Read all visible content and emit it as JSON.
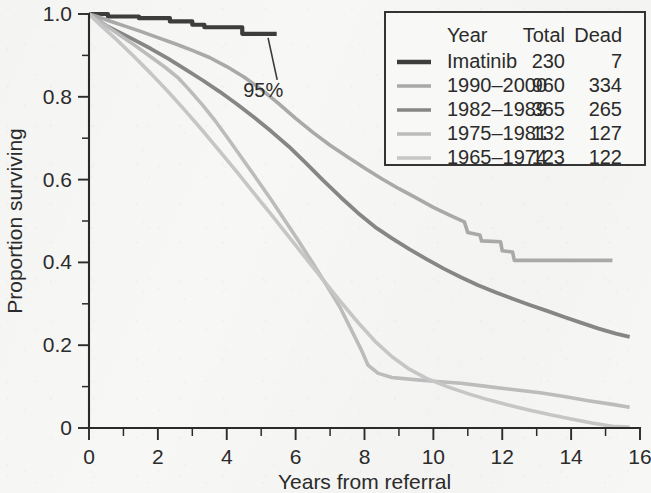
{
  "chart_data": {
    "type": "line",
    "title": "",
    "xlabel": "Years from referral",
    "ylabel": "Proportion surviving",
    "xlim": [
      0,
      16
    ],
    "ylim": [
      0,
      1.0
    ],
    "grid": false,
    "x_ticks": [
      "0",
      "2",
      "4",
      "6",
      "8",
      "10",
      "12",
      "14",
      "16"
    ],
    "x_tick_values": [
      0,
      2,
      4,
      6,
      8,
      10,
      12,
      14,
      16
    ],
    "x_minor_tick_values": [
      1,
      3,
      5,
      7,
      9,
      11,
      13,
      15
    ],
    "y_ticks": [
      "0",
      "0.2",
      "0.4",
      "0.6",
      "0.8",
      "1.0"
    ],
    "y_tick_values": [
      0,
      0.2,
      0.4,
      0.6,
      0.8,
      1.0
    ],
    "y_minor_tick_values": [
      0.1,
      0.3,
      0.5,
      0.7,
      0.9
    ],
    "legend_position": "top-right",
    "annotations": [
      {
        "text": "95%",
        "x": 5.0,
        "y": 0.8,
        "points_to_x": 5.2,
        "points_to_y": 0.952
      }
    ],
    "series": [
      {
        "name": "Imatinib",
        "total": 230,
        "dead": 7,
        "color": "#3d3d3d",
        "width": 4.2,
        "points": [
          [
            0,
            1.0
          ],
          [
            0.55,
            1.0
          ],
          [
            0.55,
            0.994
          ],
          [
            1.45,
            0.994
          ],
          [
            1.45,
            0.99
          ],
          [
            2.35,
            0.99
          ],
          [
            2.35,
            0.982
          ],
          [
            3.0,
            0.982
          ],
          [
            3.0,
            0.974
          ],
          [
            3.35,
            0.974
          ],
          [
            3.35,
            0.968
          ],
          [
            4.45,
            0.968
          ],
          [
            4.45,
            0.952
          ],
          [
            5.45,
            0.952
          ]
        ]
      },
      {
        "name": "1990–2000",
        "total": 960,
        "dead": 334,
        "color": "#a9a9a9",
        "width": 3.6,
        "points": [
          [
            0,
            1.0
          ],
          [
            0.3,
            0.992
          ],
          [
            0.6,
            0.983
          ],
          [
            1.0,
            0.972
          ],
          [
            1.5,
            0.958
          ],
          [
            2.0,
            0.943
          ],
          [
            2.5,
            0.928
          ],
          [
            3.0,
            0.912
          ],
          [
            3.5,
            0.895
          ],
          [
            4.0,
            0.873
          ],
          [
            4.5,
            0.848
          ],
          [
            5.0,
            0.818
          ],
          [
            5.5,
            0.784
          ],
          [
            6.0,
            0.748
          ],
          [
            6.5,
            0.714
          ],
          [
            7.0,
            0.683
          ],
          [
            7.5,
            0.655
          ],
          [
            8.0,
            0.628
          ],
          [
            8.5,
            0.602
          ],
          [
            9.0,
            0.578
          ],
          [
            9.5,
            0.556
          ],
          [
            10.0,
            0.533
          ],
          [
            10.5,
            0.513
          ],
          [
            10.9,
            0.498
          ],
          [
            11.0,
            0.472
          ],
          [
            11.35,
            0.466
          ],
          [
            11.4,
            0.452
          ],
          [
            11.95,
            0.45
          ],
          [
            12.0,
            0.428
          ],
          [
            12.3,
            0.425
          ],
          [
            12.35,
            0.405
          ],
          [
            15.2,
            0.405
          ]
        ]
      },
      {
        "name": "1982–1989",
        "total": 365,
        "dead": 265,
        "color": "#868686",
        "width": 3.8,
        "points": [
          [
            0,
            1.0
          ],
          [
            0.25,
            0.985
          ],
          [
            0.5,
            0.972
          ],
          [
            0.9,
            0.955
          ],
          [
            1.3,
            0.938
          ],
          [
            1.8,
            0.916
          ],
          [
            2.3,
            0.892
          ],
          [
            2.8,
            0.866
          ],
          [
            3.3,
            0.84
          ],
          [
            3.8,
            0.812
          ],
          [
            4.3,
            0.782
          ],
          [
            4.8,
            0.75
          ],
          [
            5.3,
            0.716
          ],
          [
            5.8,
            0.68
          ],
          [
            6.3,
            0.64
          ],
          [
            6.8,
            0.598
          ],
          [
            7.3,
            0.558
          ],
          [
            7.8,
            0.52
          ],
          [
            8.3,
            0.486
          ],
          [
            8.8,
            0.458
          ],
          [
            9.3,
            0.432
          ],
          [
            9.8,
            0.408
          ],
          [
            10.3,
            0.385
          ],
          [
            10.8,
            0.364
          ],
          [
            11.3,
            0.345
          ],
          [
            11.8,
            0.328
          ],
          [
            12.3,
            0.312
          ],
          [
            12.8,
            0.297
          ],
          [
            13.3,
            0.283
          ],
          [
            13.8,
            0.268
          ],
          [
            14.3,
            0.254
          ],
          [
            14.8,
            0.24
          ],
          [
            15.3,
            0.228
          ],
          [
            15.7,
            0.22
          ]
        ]
      },
      {
        "name": "1975–1981",
        "total": 132,
        "dead": 127,
        "color": "#bcbcbc",
        "width": 3.6,
        "points": [
          [
            0,
            1.0
          ],
          [
            0.3,
            0.982
          ],
          [
            0.7,
            0.96
          ],
          [
            1.2,
            0.932
          ],
          [
            1.7,
            0.902
          ],
          [
            2.2,
            0.872
          ],
          [
            2.6,
            0.845
          ],
          [
            2.9,
            0.818
          ],
          [
            3.3,
            0.78
          ],
          [
            3.7,
            0.738
          ],
          [
            4.1,
            0.692
          ],
          [
            4.5,
            0.645
          ],
          [
            4.9,
            0.598
          ],
          [
            5.3,
            0.55
          ],
          [
            5.7,
            0.5
          ],
          [
            6.1,
            0.45
          ],
          [
            6.5,
            0.398
          ],
          [
            6.9,
            0.345
          ],
          [
            7.3,
            0.29
          ],
          [
            7.6,
            0.24
          ],
          [
            7.9,
            0.19
          ],
          [
            8.1,
            0.152
          ],
          [
            8.4,
            0.132
          ],
          [
            8.8,
            0.122
          ],
          [
            9.3,
            0.118
          ],
          [
            10.0,
            0.113
          ],
          [
            10.8,
            0.108
          ],
          [
            11.6,
            0.1
          ],
          [
            12.3,
            0.093
          ],
          [
            13.1,
            0.085
          ],
          [
            13.8,
            0.076
          ],
          [
            14.5,
            0.066
          ],
          [
            15.2,
            0.057
          ],
          [
            15.7,
            0.05
          ]
        ]
      },
      {
        "name": "1965–1974",
        "total": 123,
        "dead": 122,
        "color": "#c6c6c6",
        "width": 3.6,
        "points": [
          [
            0,
            1.0
          ],
          [
            0.35,
            0.972
          ],
          [
            0.8,
            0.938
          ],
          [
            1.3,
            0.898
          ],
          [
            1.8,
            0.856
          ],
          [
            2.3,
            0.812
          ],
          [
            2.8,
            0.766
          ],
          [
            3.3,
            0.718
          ],
          [
            3.8,
            0.668
          ],
          [
            4.3,
            0.618
          ],
          [
            4.8,
            0.566
          ],
          [
            5.3,
            0.515
          ],
          [
            5.8,
            0.462
          ],
          [
            6.3,
            0.41
          ],
          [
            6.8,
            0.358
          ],
          [
            7.3,
            0.306
          ],
          [
            7.8,
            0.256
          ],
          [
            8.3,
            0.21
          ],
          [
            8.8,
            0.172
          ],
          [
            9.3,
            0.142
          ],
          [
            9.8,
            0.12
          ],
          [
            10.4,
            0.1
          ],
          [
            11.0,
            0.083
          ],
          [
            11.6,
            0.068
          ],
          [
            12.2,
            0.055
          ],
          [
            12.8,
            0.043
          ],
          [
            13.4,
            0.032
          ],
          [
            14.0,
            0.022
          ],
          [
            14.6,
            0.012
          ],
          [
            15.2,
            0.004
          ],
          [
            15.7,
            0.002
          ]
        ]
      }
    ]
  },
  "legend": {
    "headers": {
      "name": "Year",
      "total": "Total",
      "dead": "Dead"
    },
    "rows": [
      {
        "name": "Imatinib",
        "total": "230",
        "dead": "7",
        "color": "#3d3d3d"
      },
      {
        "name": "1990–2000",
        "total": "960",
        "dead": "334",
        "color": "#a9a9a9"
      },
      {
        "name": "1982–1989",
        "total": "365",
        "dead": "265",
        "color": "#868686"
      },
      {
        "name": "1975–1981",
        "total": "132",
        "dead": "127",
        "color": "#bcbcbc"
      },
      {
        "name": "1965–1974",
        "total": "123",
        "dead": "122",
        "color": "#c6c6c6"
      }
    ]
  }
}
